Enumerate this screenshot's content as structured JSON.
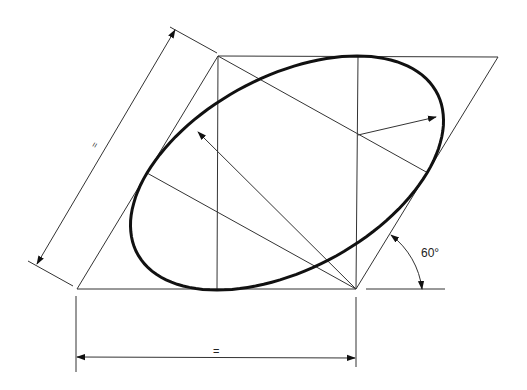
{
  "diagram": {
    "labels": {
      "angle": "60°",
      "equal_horizontal": "=",
      "equal_slanted": "="
    },
    "colors": {
      "line": "#222222",
      "ellipse": "#111111",
      "background": "#ffffff"
    }
  }
}
